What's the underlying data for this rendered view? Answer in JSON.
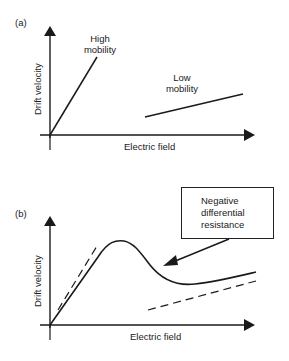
{
  "panel_a": {
    "label": "(a)",
    "y_axis_label": "Drift velocity",
    "x_axis_label": "Electric field",
    "curves": [
      {
        "name": "high-mobility",
        "label_line1": "High",
        "label_line2": "mobility"
      },
      {
        "name": "low-mobility",
        "label_line1": "Low",
        "label_line2": "mobility"
      }
    ]
  },
  "panel_b": {
    "label": "(b)",
    "y_axis_label": "Drift velocity",
    "x_axis_label": "Electric field",
    "annotation": {
      "line1": "Negative",
      "line2": "differential",
      "line3": "resistance"
    }
  },
  "colors": {
    "ink": "#1a1a1a",
    "background": "#ffffff"
  }
}
